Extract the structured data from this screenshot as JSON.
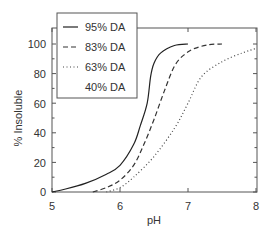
{
  "chart_data": {
    "type": "line",
    "title": "",
    "xlabel": "pH",
    "ylabel": "% Insoluble",
    "xlim": [
      5,
      8
    ],
    "ylim": [
      0,
      100
    ],
    "xticks": [
      5,
      6,
      7,
      8
    ],
    "yticks": [
      0,
      20,
      40,
      60,
      80,
      100
    ],
    "grid": false,
    "legend_position": "upper left",
    "series": [
      {
        "name": "95% DA",
        "style": "solid",
        "x": [
          5.0,
          5.2,
          5.5,
          5.8,
          6.0,
          6.2,
          6.3,
          6.4,
          6.45,
          6.5,
          6.6,
          6.8,
          7.0
        ],
        "values": [
          0,
          2,
          6,
          12,
          18,
          32,
          45,
          60,
          78,
          87,
          94,
          99,
          100
        ]
      },
      {
        "name": "83% DA",
        "style": "dashed",
        "x": [
          5.6,
          5.8,
          6.0,
          6.2,
          6.35,
          6.5,
          6.65,
          6.8,
          6.95,
          7.1,
          7.3,
          7.5
        ],
        "values": [
          0,
          3,
          8,
          18,
          32,
          49,
          68,
          85,
          93,
          97,
          99.5,
          100
        ]
      },
      {
        "name": "63% DA",
        "style": "dotted",
        "x": [
          5.8,
          6.0,
          6.2,
          6.5,
          6.8,
          7.0,
          7.2,
          7.5,
          7.8,
          8.0
        ],
        "values": [
          0,
          3,
          10,
          24,
          43,
          60,
          78,
          88,
          94,
          97
        ]
      },
      {
        "name": "40% DA",
        "style": "none",
        "x": [],
        "values": []
      }
    ]
  },
  "labels": {
    "xlabel": "pH",
    "ylabel": "% Insoluble",
    "xticks": [
      "5",
      "6",
      "7",
      "8"
    ],
    "yticks": [
      "0",
      "20",
      "40",
      "60",
      "80",
      "100"
    ],
    "legend": [
      "95% DA",
      "83% DA",
      "63% DA",
      "40% DA"
    ]
  }
}
